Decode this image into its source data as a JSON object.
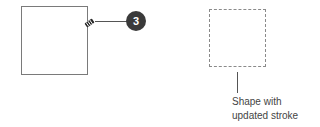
{
  "diagram": {
    "badge": {
      "number": "3",
      "fill": "#3a3a3a",
      "text_color": "#ffffff"
    },
    "solid_shape": {
      "stroke": "#7a7a7a",
      "style": "solid"
    },
    "dashed_shape": {
      "stroke": "#8a8a8a",
      "style": "dashed"
    },
    "brush_icon": "paintbrush-icon",
    "caption": {
      "line1": "Shape with",
      "line2": "updated stroke"
    }
  }
}
